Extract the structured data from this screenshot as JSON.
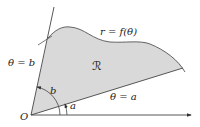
{
  "diagram": {
    "labels": {
      "curve": "r = f(θ)",
      "region": "ℛ",
      "ray_b": "θ = b",
      "ray_a": "θ = a",
      "angle_b": "b",
      "angle_a": "a",
      "origin": "O"
    },
    "colors": {
      "region_fill": "#d9d9d9",
      "stroke": "#444444",
      "background": "#ffffff"
    }
  }
}
